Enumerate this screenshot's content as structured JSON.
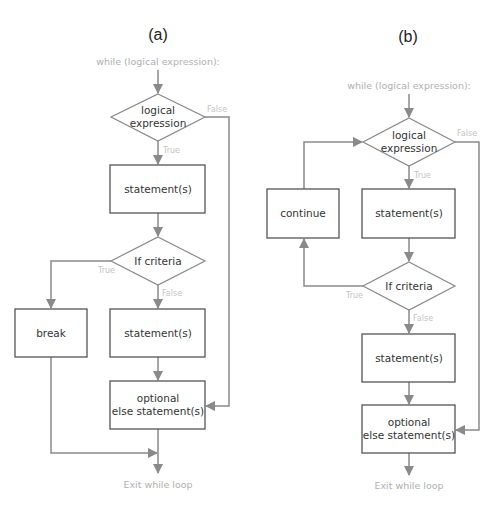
{
  "diagrams": {
    "a": {
      "title": "(a)",
      "start": "while (logical expression):",
      "cond1": [
        "logical",
        "expression"
      ],
      "cond1_false": "False",
      "cond1_true": "True",
      "stmt1": "statement(s)",
      "cond2": "If criteria",
      "cond2_true": "True",
      "cond2_false": "False",
      "break": "break",
      "stmt2": "statement(s)",
      "else": [
        "optional",
        "else statement(s)"
      ],
      "exit": "Exit while loop"
    },
    "b": {
      "title": "(b)",
      "start": "while (logical expression):",
      "cond1": [
        "logical",
        "expression"
      ],
      "cond1_false": "False",
      "cond1_true": "True",
      "continue": "continue",
      "stmt1": "statement(s)",
      "cond2": "If criteria",
      "cond2_true": "True",
      "cond2_false": "False",
      "stmt2": "statement(s)",
      "else": [
        "optional",
        "else statement(s)"
      ],
      "exit": "Exit while loop"
    }
  },
  "colors": {
    "edge": "#8a8a8a",
    "box_border": "#555555",
    "diamond_border": "#888888",
    "label_faint": "#c4c4c4"
  }
}
